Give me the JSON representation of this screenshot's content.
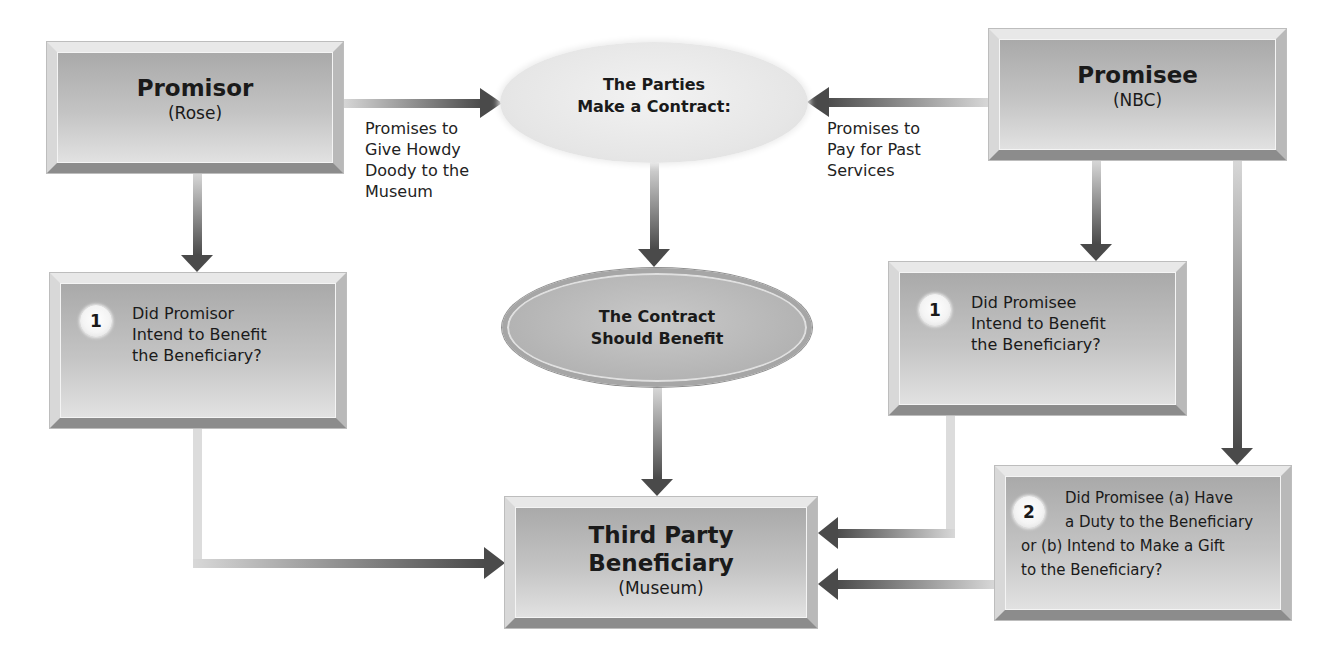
{
  "diagram": {
    "promisor": {
      "title": "Promisor",
      "subtitle": "(Rose)"
    },
    "promisee": {
      "title": "Promisee",
      "subtitle": "(NBC)"
    },
    "contract_ellipse": {
      "line1": "The Parties",
      "line2": "Make a Contract:"
    },
    "benefit_ellipse": {
      "line1": "The Contract",
      "line2": "Should Benefit"
    },
    "third_party": {
      "line1": "Third Party",
      "line2": "Beneficiary",
      "subtitle": "(Museum)"
    },
    "promisor_label": {
      "lines": [
        "Promises to",
        "Give Howdy",
        "Doody to the",
        "Museum"
      ]
    },
    "promisee_label": {
      "lines": [
        "Promises to",
        "Pay for Past",
        "Services"
      ]
    },
    "promisor_question": {
      "number": "1",
      "lines": [
        "Did Promisor",
        "Intend to Benefit",
        "the Beneficiary?"
      ]
    },
    "promisee_question1": {
      "number": "1",
      "lines": [
        "Did Promisee",
        "Intend to Benefit",
        "the Beneficiary?"
      ]
    },
    "promisee_question2": {
      "number": "2",
      "lines": [
        "Did Promisee (a) Have",
        "a Duty to the Beneficiary",
        "or (b) Intend to Make a Gift",
        "to the Beneficiary?"
      ]
    },
    "colors": {
      "arrow_dark": "#4a4a4a",
      "arrow_light": "#d4d4d4",
      "box_mid": "#bdbdbd"
    }
  }
}
